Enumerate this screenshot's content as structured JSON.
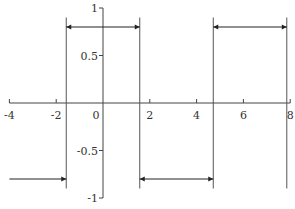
{
  "chart_data": {
    "type": "line",
    "title": "",
    "xlabel": "",
    "ylabel": "",
    "xlim": [
      -4,
      8
    ],
    "ylim": [
      -1,
      1
    ],
    "grid": false,
    "x_ticks": [
      "-4",
      "-2",
      "0",
      "2",
      "4",
      "6",
      "8"
    ],
    "y_ticks": [
      "1",
      "0.5",
      "-0.5",
      "-1"
    ],
    "series": [
      {
        "name": "step function",
        "segments": [
          {
            "x_start": -4,
            "x_end": -1.5708,
            "y": -0.8
          },
          {
            "x_start": -1.5708,
            "x_end": 1.5708,
            "y": 0.8
          },
          {
            "x_start": 1.5708,
            "x_end": 4.7124,
            "y": -0.8
          },
          {
            "x_start": 4.7124,
            "x_end": 7.854,
            "y": 0.8
          }
        ],
        "discontinuities_x": [
          -1.5708,
          1.5708,
          4.7124,
          7.854
        ]
      }
    ],
    "colors": {
      "line": "#222222",
      "axis": "#444444",
      "vertical": "#555555"
    }
  }
}
